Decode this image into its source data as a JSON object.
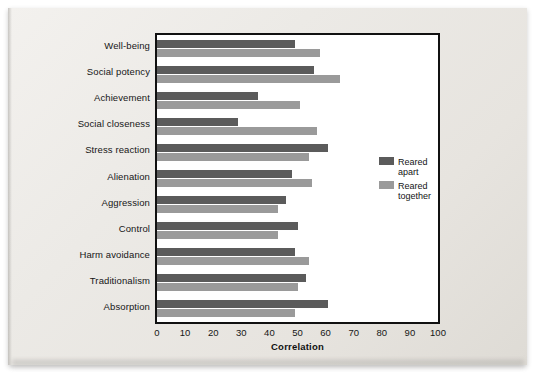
{
  "chart_data": {
    "type": "bar",
    "orientation": "horizontal",
    "title": "",
    "xlabel": "Correlation",
    "ylabel": "",
    "xlim": [
      0,
      100
    ],
    "xticks": [
      0,
      10,
      20,
      30,
      40,
      50,
      60,
      70,
      80,
      90,
      100
    ],
    "grid": false,
    "legend_position": "right",
    "categories": [
      "Well-being",
      "Social potency",
      "Achievement",
      "Social closeness",
      "Stress reaction",
      "Alienation",
      "Aggression",
      "Control",
      "Harm avoidance",
      "Traditionalism",
      "Absorption"
    ],
    "series": [
      {
        "name": "Reared apart",
        "color": "#5b5b5b",
        "values": [
          49,
          56,
          36,
          29,
          61,
          48,
          46,
          50,
          49,
          53,
          61
        ]
      },
      {
        "name": "Reared together",
        "color": "#9a9a9a",
        "values": [
          58,
          65,
          51,
          57,
          54,
          55,
          43,
          43,
          54,
          50,
          49
        ]
      }
    ]
  },
  "legend": {
    "items": [
      {
        "line1": "Reared",
        "line2": "apart"
      },
      {
        "line1": "Reared",
        "line2": "together"
      }
    ]
  }
}
